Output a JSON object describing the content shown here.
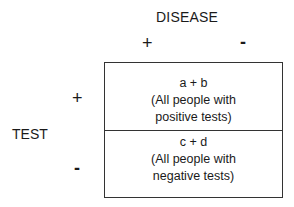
{
  "column_header": {
    "title": "DISEASE",
    "positive": "+",
    "negative": "-"
  },
  "row_header": {
    "title": "TEST",
    "positive": "+",
    "negative": "-"
  },
  "cells": [
    {
      "formula": "a + b",
      "line1": "(All people with",
      "line2": "positive tests)"
    },
    {
      "formula": "c + d",
      "line1": "(All people with",
      "line2": "negative tests)"
    }
  ]
}
